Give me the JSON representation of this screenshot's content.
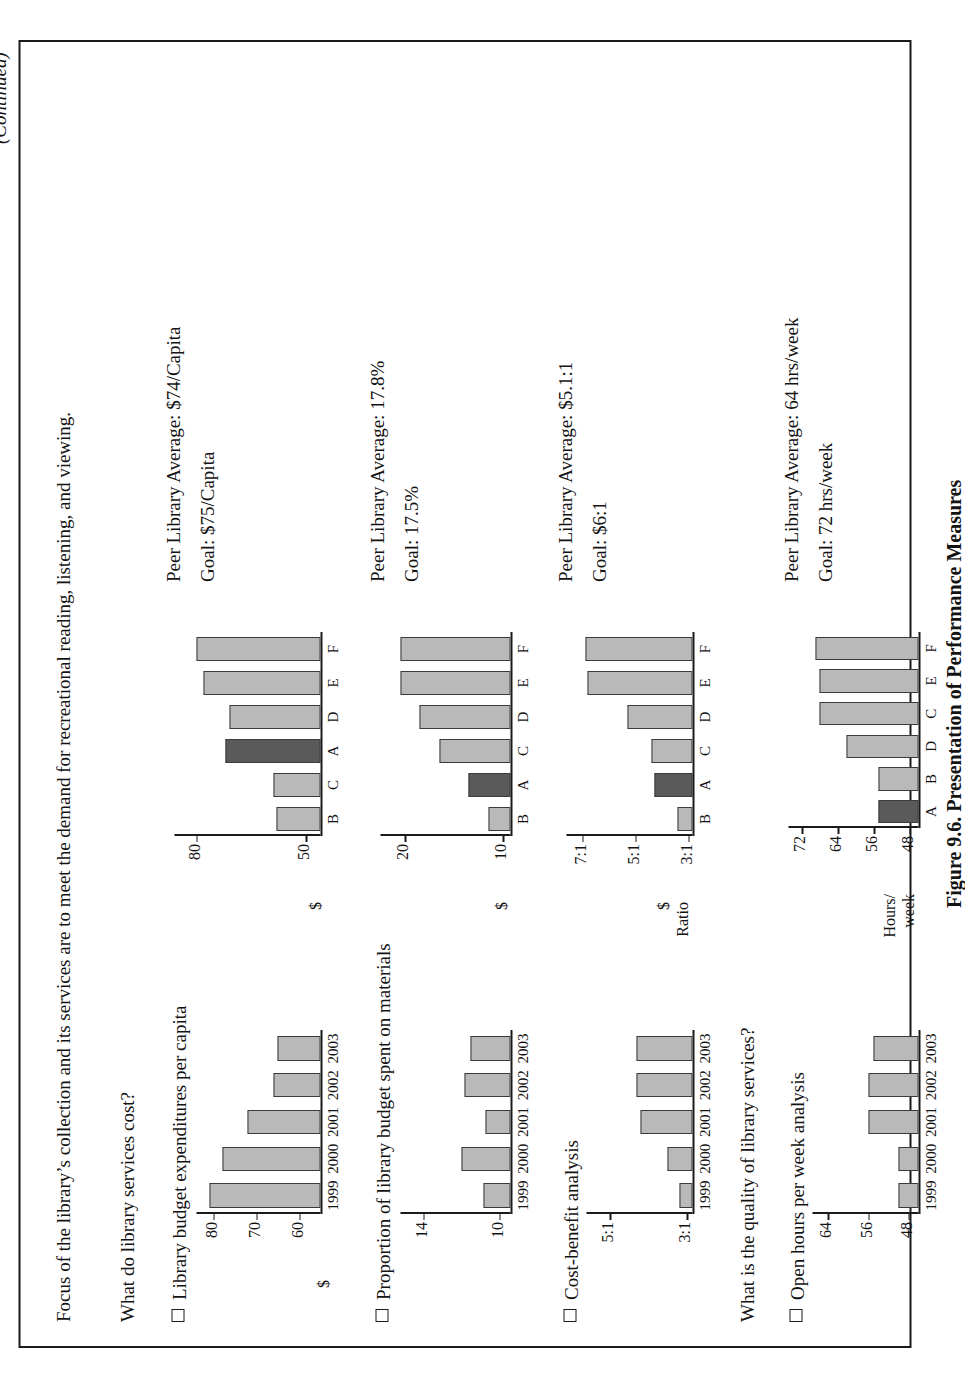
{
  "page": {
    "lead_text": "Focus of the library’s collection and its services are to meet the demand for recreational reading, listening, and viewing.",
    "continued_note": "(Continued)",
    "figure_caption": "Figure 9.6. Presentation of Performance Measures"
  },
  "questions": [
    {
      "id": "q1",
      "text": "What do library services cost?"
    },
    {
      "id": "q2",
      "text": "What is the quality of library services?"
    }
  ],
  "measures": [
    {
      "id": "m1",
      "label": "Library budget expenditures per capita",
      "peer_average": "Peer Library Average: $74/Capita",
      "goal": "Goal: $75/Capita",
      "trend": {
        "type": "bar",
        "title": "Library budget expenditures per capita",
        "categories": [
          "1999",
          "2000",
          "2001",
          "2002",
          "2003"
        ],
        "values": [
          81,
          78,
          72,
          66,
          65
        ],
        "ylabel": "$",
        "ytick_labels": [
          "60",
          "70",
          "80"
        ],
        "ytick_values": [
          60,
          70,
          80
        ],
        "ylim": [
          55,
          84
        ],
        "grid": false
      },
      "peer": {
        "type": "bar",
        "title": "Library budget expenditures per capita – peer comparison",
        "categories": [
          "B",
          "C",
          "A",
          "D",
          "E",
          "F"
        ],
        "values": [
          58,
          59,
          72,
          71,
          78,
          80
        ],
        "highlight_index": 2,
        "ylabel": "$",
        "ytick_labels": [
          "50",
          "80"
        ],
        "ytick_values": [
          50,
          80
        ],
        "ylim": [
          46,
          86
        ],
        "grid": false
      }
    },
    {
      "id": "m2",
      "label": "Proportion of library budget spent on materials",
      "peer_average": "Peer Library Average: 17.8%",
      "goal": "Goal: 17.5%",
      "trend": {
        "type": "bar",
        "title": "Proportion of library budget spent on materials",
        "categories": [
          "1999",
          "2000",
          "2001",
          "2002",
          "2003"
        ],
        "values": [
          10.8,
          12.0,
          10.7,
          11.8,
          11.5
        ],
        "ytick_labels": [
          "10",
          "14"
        ],
        "ytick_values": [
          10,
          14
        ],
        "ylim": [
          9.4,
          15.2
        ],
        "grid": false
      },
      "peer": {
        "type": "bar",
        "title": "Proportion of library budget spent on materials – peer comparison",
        "categories": [
          "B",
          "A",
          "C",
          "D",
          "E",
          "F"
        ],
        "values": [
          11.5,
          13.5,
          16.5,
          18.5,
          20.5,
          20.5
        ],
        "highlight_index": 1,
        "ylabel": "$",
        "ytick_labels": [
          "10",
          "20"
        ],
        "ytick_values": [
          10,
          20
        ],
        "ylim": [
          9.2,
          22.5
        ],
        "grid": false
      }
    },
    {
      "id": "m3",
      "label": "Cost-benefit analysis",
      "peer_average": "Peer Library Average: $5.1:1",
      "goal": "Goal: $6:1",
      "trend": {
        "type": "bar",
        "title": "Cost-benefit analysis",
        "categories": [
          "1999",
          "2000",
          "2001",
          "2002",
          "2003"
        ],
        "values": [
          3.2,
          3.5,
          4.2,
          4.3,
          4.3
        ],
        "ytick_labels": [
          "3:1",
          "5:1"
        ],
        "ytick_values": [
          3,
          5
        ],
        "ylim": [
          2.85,
          5.6
        ],
        "grid": false
      },
      "peer": {
        "type": "bar",
        "title": "Cost-benefit analysis – peer comparison",
        "categories": [
          "B",
          "A",
          "C",
          "D",
          "E",
          "F"
        ],
        "values": [
          3.4,
          4.3,
          4.4,
          5.3,
          6.8,
          6.9
        ],
        "highlight_index": 1,
        "ylabel": "$",
        "ylabel2": "Ratio",
        "ytick_labels": [
          "3:1",
          "5:1",
          "7:1"
        ],
        "ytick_values": [
          3,
          5,
          7
        ],
        "ylim": [
          2.85,
          7.6
        ],
        "grid": false
      }
    },
    {
      "id": "m4",
      "label": "Open hours per week analysis",
      "peer_average": "Peer Library Average: 64 hrs/week",
      "goal": "Goal: 72 hrs/week",
      "trend": {
        "type": "bar",
        "title": "Open hours per week analysis",
        "categories": [
          "1999",
          "2000",
          "2001",
          "2002",
          "2003"
        ],
        "values": [
          50,
          50,
          56,
          56,
          55
        ],
        "ytick_labels": [
          "48",
          "56",
          "64"
        ],
        "ytick_values": [
          48,
          56,
          64
        ],
        "ylim": [
          46,
          67
        ],
        "grid": false
      },
      "peer": {
        "type": "bar",
        "title": "Open hours per week analysis – peer comparison",
        "categories": [
          "A",
          "B",
          "D",
          "C",
          "E",
          "F"
        ],
        "values": [
          55,
          55,
          62,
          68,
          68,
          69
        ],
        "highlight_index": 0,
        "ylabel": "Hours/",
        "ylabel2": "week",
        "ytick_labels": [
          "48",
          "56",
          "64",
          "72"
        ],
        "ytick_values": [
          48,
          56,
          64,
          72
        ],
        "ylim": [
          46,
          75
        ],
        "grid": false
      }
    }
  ],
  "colors": {
    "bar_fill": "#b9b9b9",
    "bar_highlight": "#5a5a5a",
    "bar_stroke": "#3a3a3a",
    "ink": "#131313",
    "paper": "#ffffff"
  },
  "chart_data": [
    {
      "type": "bar",
      "title": "Library budget expenditures per capita",
      "categories": [
        "1999",
        "2000",
        "2001",
        "2002",
        "2003"
      ],
      "values": [
        81,
        78,
        72,
        66,
        65
      ],
      "xlabel": "",
      "ylabel": "$",
      "ylim": [
        55,
        84
      ]
    },
    {
      "type": "bar",
      "title": "Library budget expenditures per capita — peer libraries",
      "categories": [
        "B",
        "C",
        "A",
        "D",
        "E",
        "F"
      ],
      "values": [
        58,
        59,
        72,
        71,
        78,
        80
      ],
      "xlabel": "",
      "ylabel": "$",
      "ylim": [
        46,
        86
      ]
    },
    {
      "type": "bar",
      "title": "Proportion of library budget spent on materials",
      "categories": [
        "1999",
        "2000",
        "2001",
        "2002",
        "2003"
      ],
      "values": [
        10.8,
        12.0,
        10.7,
        11.8,
        11.5
      ],
      "xlabel": "",
      "ylabel": "",
      "ylim": [
        9.4,
        15.2
      ]
    },
    {
      "type": "bar",
      "title": "Proportion of library budget spent on materials — peer libraries",
      "categories": [
        "B",
        "A",
        "C",
        "D",
        "E",
        "F"
      ],
      "values": [
        11.5,
        13.5,
        16.5,
        18.5,
        20.5,
        20.5
      ],
      "xlabel": "",
      "ylabel": "$",
      "ylim": [
        9.2,
        22.5
      ]
    },
    {
      "type": "bar",
      "title": "Cost-benefit analysis",
      "categories": [
        "1999",
        "2000",
        "2001",
        "2002",
        "2003"
      ],
      "values": [
        3.2,
        3.5,
        4.2,
        4.3,
        4.3
      ],
      "xlabel": "",
      "ylabel": "Ratio",
      "ylim": [
        2.85,
        5.6
      ]
    },
    {
      "type": "bar",
      "title": "Cost-benefit analysis — peer libraries",
      "categories": [
        "B",
        "A",
        "C",
        "D",
        "E",
        "F"
      ],
      "values": [
        3.4,
        4.3,
        4.4,
        5.3,
        6.8,
        6.9
      ],
      "xlabel": "",
      "ylabel": "$ Ratio",
      "ylim": [
        2.85,
        7.6
      ]
    },
    {
      "type": "bar",
      "title": "Open hours per week analysis",
      "categories": [
        "1999",
        "2000",
        "2001",
        "2002",
        "2003"
      ],
      "values": [
        50,
        50,
        56,
        56,
        55
      ],
      "xlabel": "",
      "ylabel": "",
      "ylim": [
        46,
        67
      ]
    },
    {
      "type": "bar",
      "title": "Open hours per week analysis — peer libraries",
      "categories": [
        "A",
        "B",
        "D",
        "C",
        "E",
        "F"
      ],
      "values": [
        55,
        55,
        62,
        68,
        68,
        69
      ],
      "xlabel": "",
      "ylabel": "Hours/week",
      "ylim": [
        46,
        75
      ]
    }
  ]
}
